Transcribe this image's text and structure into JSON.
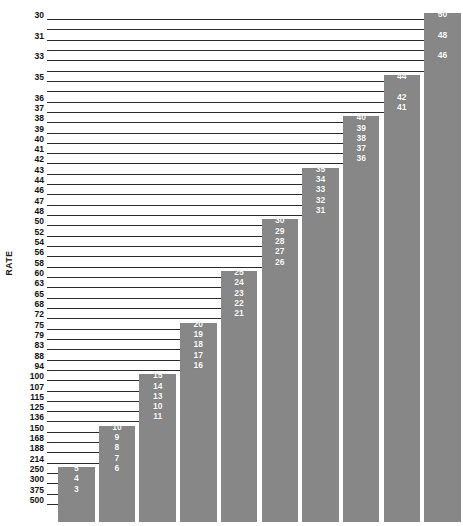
{
  "chart_data": {
    "type": "bar",
    "title": "",
    "subtitle": "",
    "xlabel": "",
    "ylabel": "RATE",
    "grid": false,
    "legend_position": "none",
    "orientation": "vertical",
    "bar_color": "#878787",
    "label_color": "#ffffff",
    "axis_color": "#2b2b2b",
    "note": "Monochrome step/staircase bar chart. Left axis lists RATE tick values (descending scale, log-like spacing). Numeric labels 3-50 are printed in white inside the bar tops at the tick row matching their rate.",
    "y_tick_labels": [
      "30",
      "",
      "31",
      "",
      "33",
      "",
      "35",
      "",
      "36",
      "37",
      "38",
      "39",
      "40",
      "41",
      "42",
      "43",
      "44",
      "46",
      "47",
      "48",
      "50",
      "52",
      "54",
      "56",
      "58",
      "60",
      "63",
      "65",
      "68",
      "72",
      "75",
      "79",
      "83",
      "88",
      "94",
      "100",
      "107",
      "115",
      "125",
      "136",
      "150",
      "168",
      "188",
      "214",
      "250",
      "300",
      "375",
      "500"
    ],
    "y_axis_values": [
      30,
      null,
      31,
      null,
      33,
      null,
      35,
      null,
      36,
      37,
      38,
      39,
      40,
      41,
      42,
      43,
      44,
      46,
      47,
      48,
      50,
      52,
      54,
      56,
      58,
      60,
      63,
      65,
      68,
      72,
      75,
      79,
      83,
      88,
      94,
      100,
      107,
      115,
      125,
      136,
      150,
      168,
      188,
      214,
      250,
      300,
      375,
      500
    ],
    "bars": [
      {
        "index": 1,
        "labels": [
          "5",
          "4",
          "3"
        ],
        "top_tick_index": 44,
        "top_rate": 250,
        "values": [
          5,
          4,
          3
        ]
      },
      {
        "index": 2,
        "labels": [
          "10",
          "9",
          "8",
          "7",
          "6"
        ],
        "top_tick_index": 40,
        "top_rate": 150,
        "values": [
          10,
          9,
          8,
          7,
          6
        ]
      },
      {
        "index": 3,
        "labels": [
          "15",
          "14",
          "13",
          "10",
          "11"
        ],
        "top_tick_index": 35,
        "top_rate": 100,
        "values": [
          15,
          14,
          13,
          10,
          11
        ]
      },
      {
        "index": 4,
        "labels": [
          "20",
          "19",
          "18",
          "17",
          "16"
        ],
        "top_tick_index": 30,
        "top_rate": 75,
        "values": [
          20,
          19,
          18,
          17,
          16
        ]
      },
      {
        "index": 5,
        "labels": [
          "25",
          "24",
          "23",
          "22",
          "21"
        ],
        "top_tick_index": 25,
        "top_rate": 60,
        "values": [
          25,
          24,
          23,
          22,
          21
        ]
      },
      {
        "index": 6,
        "labels": [
          "30",
          "29",
          "28",
          "27",
          "26"
        ],
        "top_tick_index": 20,
        "top_rate": 50,
        "values": [
          30,
          29,
          28,
          27,
          26
        ]
      },
      {
        "index": 7,
        "labels": [
          "35",
          "34",
          "33",
          "32",
          "31"
        ],
        "top_tick_index": 15,
        "top_rate": 43,
        "values": [
          35,
          34,
          33,
          32,
          31
        ]
      },
      {
        "index": 8,
        "labels": [
          "40",
          "39",
          "38",
          "37",
          "36"
        ],
        "top_tick_index": 10,
        "top_rate": 38,
        "values": [
          40,
          39,
          38,
          37,
          36
        ]
      },
      {
        "index": 9,
        "labels": [
          "44",
          "",
          "42",
          "41"
        ],
        "top_tick_index": 6,
        "top_rate": 35,
        "values": [
          44,
          42,
          41
        ]
      },
      {
        "index": 10,
        "labels": [
          "50",
          "",
          "48",
          "",
          "46"
        ],
        "top_tick_index": 0,
        "top_rate": 30,
        "values": [
          50,
          48,
          46
        ]
      }
    ]
  }
}
